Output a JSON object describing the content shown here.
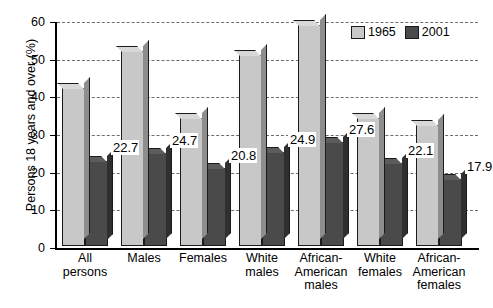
{
  "chart_data": {
    "type": "bar",
    "title": "",
    "subtitle": "",
    "xlabel": "",
    "ylabel": "Persons 18 years and over (%)",
    "ylim": [
      0,
      60
    ],
    "ytick_values": [
      0,
      10,
      20,
      30,
      40,
      50,
      60
    ],
    "ytick_labels": [
      "0",
      "10",
      "20",
      "30",
      "40",
      "50",
      "60"
    ],
    "grid": true,
    "grid_axis": "y",
    "grid_style": "dashed",
    "legend_position": "top-right",
    "categories": [
      "All\npersons",
      "Males",
      "Females",
      "White\nmales",
      "African-\nAmerican\nmales",
      "White\nfemales",
      "African-\nAmerican\nfemales"
    ],
    "series": [
      {
        "name": "1965",
        "color": "#c8c8c8",
        "values": [
          42.0,
          51.9,
          33.9,
          50.8,
          58.8,
          34.0,
          32.0
        ],
        "labels": [
          "",
          "",
          "",
          "",
          "",
          "",
          ""
        ]
      },
      {
        "name": "2001",
        "color": "#4a4a4a",
        "values": [
          22.7,
          24.7,
          20.8,
          24.9,
          27.6,
          22.1,
          17.9
        ],
        "labels": [
          "22.7",
          "24.7",
          "20.8",
          "24.9",
          "27.6",
          "22.1",
          "17.9"
        ]
      }
    ]
  },
  "legend": {
    "items": [
      {
        "label": "1965",
        "color": "#c8c8c8"
      },
      {
        "label": "2001",
        "color": "#4a4a4a"
      }
    ]
  }
}
